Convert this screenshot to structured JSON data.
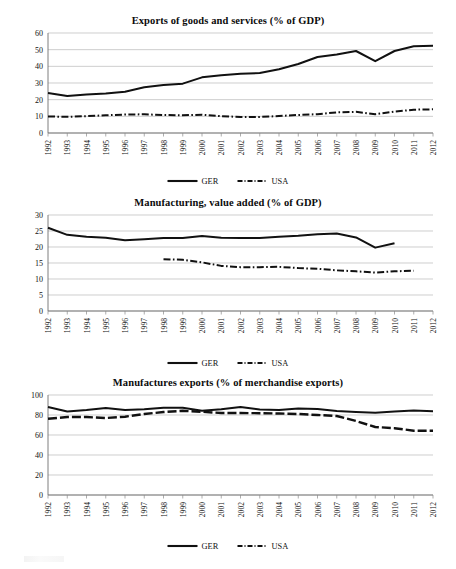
{
  "document": {
    "kind": "figure-panel",
    "panel_count": 3,
    "background_color": "#ffffff",
    "ink_color": "#111111",
    "gridline_color": "#b9b9b9"
  },
  "legend": {
    "ger_label": "GER",
    "usa_label": "USA",
    "ger_style": "solid",
    "usa_style": "dash-dot"
  },
  "years": [
    1992,
    1993,
    1994,
    1995,
    1996,
    1997,
    1998,
    1999,
    2000,
    2001,
    2002,
    2003,
    2004,
    2005,
    2006,
    2007,
    2008,
    2009,
    2010,
    2011,
    2012
  ],
  "year_labels": [
    "1992",
    "1993",
    "1994",
    "1995",
    "1996",
    "1997",
    "1998",
    "1999",
    "2000",
    "2001",
    "2002",
    "2003",
    "2004",
    "2005",
    "2006",
    "2007",
    "2008",
    "2009",
    "2010",
    "2011",
    "2012"
  ],
  "chart_data": [
    {
      "id": "exports-goods-services",
      "type": "line",
      "title": "Exports of goods and services (% of GDP)",
      "xlabel": "",
      "ylabel": "",
      "ylim": [
        0,
        60
      ],
      "yticks": [
        0,
        10,
        20,
        30,
        40,
        50,
        60
      ],
      "ytick_labels": [
        "0",
        "10",
        "20",
        "30",
        "40",
        "50",
        "60"
      ],
      "grid": true,
      "legend_position": "bottom-center",
      "x": [
        1992,
        1993,
        1994,
        1995,
        1996,
        1997,
        1998,
        1999,
        2000,
        2001,
        2002,
        2003,
        2004,
        2005,
        2006,
        2007,
        2008,
        2009,
        2010,
        2011,
        2012
      ],
      "series": [
        {
          "name": "GER",
          "style": "solid",
          "values": [
            24.0,
            22.2,
            23.1,
            23.7,
            24.8,
            27.4,
            28.8,
            29.6,
            33.4,
            34.7,
            35.6,
            36.0,
            38.3,
            41.4,
            45.6,
            47.1,
            49.2,
            43.1,
            49.2,
            52.0,
            52.3
          ]
        },
        {
          "name": "USA",
          "style": "dash-dot",
          "values": [
            9.9,
            9.7,
            10.1,
            10.6,
            11.1,
            11.2,
            10.8,
            10.6,
            11.0,
            10.1,
            9.6,
            9.6,
            10.2,
            10.8,
            11.3,
            12.4,
            12.7,
            11.3,
            12.8,
            14.0,
            14.2
          ]
        }
      ]
    },
    {
      "id": "manufacturing-value-added",
      "type": "line",
      "title": "Manufacturing, value added (% of GDP)",
      "xlabel": "",
      "ylabel": "",
      "ylim": [
        0,
        30
      ],
      "yticks": [
        0,
        5,
        10,
        15,
        20,
        25,
        30
      ],
      "ytick_labels": [
        "0",
        "5",
        "10",
        "15",
        "20",
        "25",
        "30"
      ],
      "grid": true,
      "legend_position": "bottom-center",
      "x": [
        1992,
        1993,
        1994,
        1995,
        1996,
        1997,
        1998,
        1999,
        2000,
        2001,
        2002,
        2003,
        2004,
        2005,
        2006,
        2007,
        2008,
        2009,
        2010,
        2011,
        2012
      ],
      "series": [
        {
          "name": "GER",
          "style": "solid",
          "values": [
            26.0,
            23.8,
            23.2,
            22.9,
            22.1,
            22.4,
            22.8,
            22.8,
            23.4,
            22.9,
            22.8,
            22.8,
            23.2,
            23.5,
            24.0,
            24.2,
            23.0,
            19.8,
            21.2,
            null,
            null
          ]
        },
        {
          "name": "USA",
          "style": "dash-dot",
          "values": [
            null,
            null,
            null,
            null,
            null,
            null,
            16.2,
            16.0,
            15.2,
            14.1,
            13.7,
            13.7,
            13.8,
            13.4,
            13.2,
            12.7,
            12.4,
            12.0,
            12.4,
            12.6,
            null
          ]
        }
      ]
    },
    {
      "id": "manufactures-exports",
      "type": "line",
      "title": "Manufactures exports (% of merchandise exports)",
      "xlabel": "",
      "ylabel": "",
      "ylim": [
        0,
        100
      ],
      "yticks": [
        0,
        20,
        40,
        60,
        80,
        100
      ],
      "ytick_labels": [
        "0",
        "20",
        "40",
        "60",
        "80",
        "100"
      ],
      "grid": true,
      "legend_position": "bottom-center",
      "x": [
        1992,
        1993,
        1994,
        1995,
        1996,
        1997,
        1998,
        1999,
        2000,
        2001,
        2002,
        2003,
        2004,
        2005,
        2006,
        2007,
        2008,
        2009,
        2010,
        2011,
        2012
      ],
      "series": [
        {
          "name": "GER",
          "style": "dashed-thick-solid",
          "values": [
            88.0,
            83.5,
            85.0,
            87.0,
            85.0,
            85.8,
            87.3,
            87.2,
            84.2,
            85.8,
            88.0,
            85.5,
            85.0,
            86.5,
            86.0,
            84.0,
            83.0,
            82.3,
            83.5,
            84.5,
            83.8
          ]
        },
        {
          "name": "USA",
          "style": "dashed",
          "values": [
            76.2,
            78.0,
            78.0,
            77.0,
            78.3,
            81.0,
            83.0,
            84.2,
            83.2,
            82.0,
            82.0,
            81.8,
            81.5,
            81.0,
            80.0,
            79.0,
            74.0,
            68.0,
            66.8,
            64.3,
            64.3
          ]
        }
      ]
    }
  ]
}
